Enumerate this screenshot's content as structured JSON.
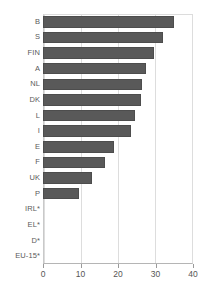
{
  "chart_data": {
    "type": "bar",
    "orientation": "horizontal",
    "title": "",
    "subtitle": "",
    "xlabel": "",
    "ylabel": "",
    "xlim": [
      0,
      40
    ],
    "xticks": [
      0,
      10,
      20,
      30,
      40
    ],
    "xtick_labels": [
      "0",
      "10",
      "20",
      "30",
      "40"
    ],
    "grid": true,
    "grid_axis": "x",
    "legend": false,
    "legend_position": "none",
    "bar_color": "#595959",
    "categories": [
      "B",
      "S",
      "FIN",
      "A",
      "NL",
      "DK",
      "L",
      "I",
      "E",
      "F",
      "UK",
      "P",
      "IRL*",
      "EL*",
      "D*",
      "EU-15*"
    ],
    "values": [
      35,
      32,
      29.5,
      27.5,
      26.5,
      26,
      24.5,
      23.5,
      19,
      16.5,
      13,
      9.5,
      0,
      0,
      0,
      0
    ],
    "series": [
      {
        "name": "",
        "values": [
          35,
          32,
          29.5,
          27.5,
          26.5,
          26,
          24.5,
          23.5,
          19,
          16.5,
          13,
          9.5,
          0,
          0,
          0,
          0
        ]
      }
    ],
    "annotations": []
  },
  "colors": {
    "bar": "#595959",
    "bar_edge": "#4d4d4d",
    "gridline": "#dddddd",
    "axis": "#b5b5b5",
    "tick_text": "#555555",
    "label_text": "#5a5a5a",
    "background": "#ffffff"
  }
}
